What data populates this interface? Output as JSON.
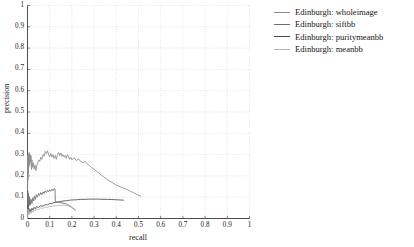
{
  "chart_data": {
    "type": "line",
    "title": "",
    "xlabel": "recall",
    "ylabel": "precision",
    "xlim": [
      0,
      1
    ],
    "ylim": [
      0,
      1
    ],
    "grid": true,
    "grid_style": "dotted",
    "legend_position": "right-outside",
    "xticks": [
      "0",
      "0.1",
      "0.2",
      "0.3",
      "0.4",
      "0.5",
      "0.6",
      "0.7",
      "0.8",
      "0.9",
      "1"
    ],
    "xtick_values": [
      0,
      0.1,
      0.2,
      0.3,
      0.4,
      0.5,
      0.6,
      0.7,
      0.8,
      0.9,
      1
    ],
    "yticks": [
      "0",
      "0.1",
      "0.2",
      "0.3",
      "0.4",
      "0.5",
      "0.6",
      "0.7",
      "0.8",
      "0.9",
      "1"
    ],
    "ytick_values": [
      0,
      0.1,
      0.2,
      0.3,
      0.4,
      0.5,
      0.6,
      0.7,
      0.8,
      0.9,
      1
    ],
    "series": [
      {
        "name": "Edinburgh: wholeimage",
        "color": "#8c8c8c",
        "points": [
          [
            0.0,
            0.0
          ],
          [
            0.001,
            0.3
          ],
          [
            0.002,
            0.18
          ],
          [
            0.003,
            0.29
          ],
          [
            0.004,
            0.21
          ],
          [
            0.005,
            0.3
          ],
          [
            0.006,
            0.24
          ],
          [
            0.008,
            0.31
          ],
          [
            0.01,
            0.25
          ],
          [
            0.012,
            0.3
          ],
          [
            0.014,
            0.265
          ],
          [
            0.016,
            0.295
          ],
          [
            0.018,
            0.23
          ],
          [
            0.02,
            0.275
          ],
          [
            0.023,
            0.24
          ],
          [
            0.026,
            0.262
          ],
          [
            0.03,
            0.232
          ],
          [
            0.034,
            0.252
          ],
          [
            0.038,
            0.225
          ],
          [
            0.042,
            0.248
          ],
          [
            0.046,
            0.262
          ],
          [
            0.05,
            0.275
          ],
          [
            0.055,
            0.268
          ],
          [
            0.06,
            0.288
          ],
          [
            0.065,
            0.278
          ],
          [
            0.07,
            0.3
          ],
          [
            0.075,
            0.292
          ],
          [
            0.08,
            0.315
          ],
          [
            0.085,
            0.305
          ],
          [
            0.09,
            0.318
          ],
          [
            0.095,
            0.3
          ],
          [
            0.1,
            0.29
          ],
          [
            0.105,
            0.305
          ],
          [
            0.11,
            0.288
          ],
          [
            0.115,
            0.3
          ],
          [
            0.12,
            0.282
          ],
          [
            0.125,
            0.296
          ],
          [
            0.13,
            0.278
          ],
          [
            0.135,
            0.3
          ],
          [
            0.14,
            0.31
          ],
          [
            0.145,
            0.295
          ],
          [
            0.15,
            0.308
          ],
          [
            0.155,
            0.292
          ],
          [
            0.16,
            0.3
          ],
          [
            0.165,
            0.288
          ],
          [
            0.17,
            0.296
          ],
          [
            0.175,
            0.282
          ],
          [
            0.18,
            0.3
          ],
          [
            0.185,
            0.29
          ],
          [
            0.19,
            0.278
          ],
          [
            0.195,
            0.288
          ],
          [
            0.2,
            0.275
          ],
          [
            0.21,
            0.285
          ],
          [
            0.22,
            0.272
          ],
          [
            0.23,
            0.28
          ],
          [
            0.24,
            0.268
          ],
          [
            0.25,
            0.262
          ],
          [
            0.26,
            0.268
          ],
          [
            0.27,
            0.255
          ],
          [
            0.28,
            0.248
          ],
          [
            0.29,
            0.238
          ],
          [
            0.3,
            0.232
          ],
          [
            0.31,
            0.222
          ],
          [
            0.32,
            0.215
          ],
          [
            0.33,
            0.205
          ],
          [
            0.34,
            0.198
          ],
          [
            0.35,
            0.19
          ],
          [
            0.36,
            0.182
          ],
          [
            0.37,
            0.175
          ],
          [
            0.38,
            0.17
          ],
          [
            0.39,
            0.163
          ],
          [
            0.4,
            0.157
          ],
          [
            0.42,
            0.148
          ],
          [
            0.44,
            0.14
          ],
          [
            0.46,
            0.13
          ],
          [
            0.48,
            0.12
          ],
          [
            0.495,
            0.112
          ],
          [
            0.51,
            0.105
          ]
        ]
      },
      {
        "name": "Edinburgh: siftbb",
        "color": "#6e6e6e",
        "points": [
          [
            0.0,
            0.0
          ],
          [
            0.001,
            0.13
          ],
          [
            0.002,
            0.06
          ],
          [
            0.003,
            0.12
          ],
          [
            0.004,
            0.055
          ],
          [
            0.006,
            0.105
          ],
          [
            0.008,
            0.06
          ],
          [
            0.01,
            0.095
          ],
          [
            0.013,
            0.065
          ],
          [
            0.016,
            0.09
          ],
          [
            0.02,
            0.07
          ],
          [
            0.024,
            0.098
          ],
          [
            0.028,
            0.082
          ],
          [
            0.032,
            0.105
          ],
          [
            0.036,
            0.09
          ],
          [
            0.04,
            0.112
          ],
          [
            0.045,
            0.1
          ],
          [
            0.05,
            0.118
          ],
          [
            0.055,
            0.108
          ],
          [
            0.06,
            0.122
          ],
          [
            0.065,
            0.112
          ],
          [
            0.07,
            0.125
          ],
          [
            0.075,
            0.118
          ],
          [
            0.08,
            0.13
          ],
          [
            0.085,
            0.122
          ],
          [
            0.09,
            0.132
          ],
          [
            0.095,
            0.125
          ],
          [
            0.1,
            0.135
          ],
          [
            0.105,
            0.128
          ],
          [
            0.11,
            0.138
          ],
          [
            0.115,
            0.13
          ],
          [
            0.12,
            0.14
          ],
          [
            0.124,
            0.138
          ],
          [
            0.125,
            0.08
          ],
          [
            0.13,
            0.078
          ],
          [
            0.14,
            0.076
          ],
          [
            0.15,
            0.074
          ],
          [
            0.16,
            0.072
          ],
          [
            0.17,
            0.07
          ],
          [
            0.18,
            0.066
          ],
          [
            0.19,
            0.06
          ],
          [
            0.2,
            0.052
          ],
          [
            0.21,
            0.044
          ],
          [
            0.215,
            0.04
          ]
        ]
      },
      {
        "name": "Edinburgh: puritymeanbb",
        "color": "#4a4a4a",
        "points": [
          [
            0.0,
            0.0
          ],
          [
            0.002,
            0.06
          ],
          [
            0.004,
            0.03
          ],
          [
            0.006,
            0.048
          ],
          [
            0.008,
            0.028
          ],
          [
            0.012,
            0.042
          ],
          [
            0.016,
            0.032
          ],
          [
            0.02,
            0.048
          ],
          [
            0.025,
            0.04
          ],
          [
            0.03,
            0.052
          ],
          [
            0.035,
            0.046
          ],
          [
            0.04,
            0.056
          ],
          [
            0.05,
            0.052
          ],
          [
            0.06,
            0.06
          ],
          [
            0.07,
            0.058
          ],
          [
            0.08,
            0.065
          ],
          [
            0.09,
            0.064
          ],
          [
            0.1,
            0.07
          ],
          [
            0.11,
            0.07
          ],
          [
            0.12,
            0.075
          ],
          [
            0.13,
            0.076
          ],
          [
            0.14,
            0.078
          ],
          [
            0.15,
            0.08
          ],
          [
            0.16,
            0.082
          ],
          [
            0.17,
            0.083
          ],
          [
            0.18,
            0.084
          ],
          [
            0.19,
            0.086
          ],
          [
            0.2,
            0.087
          ],
          [
            0.22,
            0.088
          ],
          [
            0.24,
            0.09
          ],
          [
            0.26,
            0.09
          ],
          [
            0.28,
            0.091
          ],
          [
            0.3,
            0.091
          ],
          [
            0.32,
            0.091
          ],
          [
            0.34,
            0.09
          ],
          [
            0.36,
            0.09
          ],
          [
            0.38,
            0.089
          ],
          [
            0.4,
            0.088
          ],
          [
            0.42,
            0.087
          ],
          [
            0.432,
            0.086
          ]
        ]
      },
      {
        "name": "Edinburgh: meanbb",
        "color": "#b4b4b4",
        "points": [
          [
            0.0,
            0.0
          ],
          [
            0.002,
            0.045
          ],
          [
            0.004,
            0.018
          ],
          [
            0.006,
            0.038
          ],
          [
            0.009,
            0.02
          ],
          [
            0.012,
            0.034
          ],
          [
            0.016,
            0.024
          ],
          [
            0.02,
            0.038
          ],
          [
            0.025,
            0.03
          ],
          [
            0.03,
            0.042
          ],
          [
            0.035,
            0.036
          ],
          [
            0.04,
            0.046
          ],
          [
            0.05,
            0.042
          ],
          [
            0.06,
            0.05
          ],
          [
            0.07,
            0.048
          ],
          [
            0.08,
            0.054
          ],
          [
            0.09,
            0.052
          ],
          [
            0.1,
            0.057
          ],
          [
            0.11,
            0.056
          ],
          [
            0.12,
            0.06
          ],
          [
            0.13,
            0.06
          ],
          [
            0.14,
            0.062
          ],
          [
            0.15,
            0.062
          ],
          [
            0.16,
            0.063
          ],
          [
            0.17,
            0.062
          ],
          [
            0.18,
            0.06
          ],
          [
            0.19,
            0.056
          ],
          [
            0.2,
            0.05
          ],
          [
            0.208,
            0.044
          ],
          [
            0.214,
            0.038
          ]
        ]
      }
    ]
  },
  "legend": {
    "items": [
      {
        "label": "Edinburgh: wholeimage",
        "color": "#8c8c8c"
      },
      {
        "label": "Edinburgh: siftbb",
        "color": "#6e6e6e"
      },
      {
        "label": "Edinburgh: puritymeanbb",
        "color": "#4a4a4a"
      },
      {
        "label": "Edinburgh: meanbb",
        "color": "#b4b4b4"
      }
    ]
  }
}
